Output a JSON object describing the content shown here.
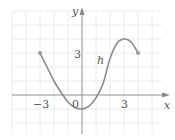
{
  "chart_data": {
    "type": "line",
    "title": "",
    "function_label": "h",
    "xlabel": "x",
    "ylabel": "y",
    "origin_label": "0",
    "x_tick_labels": [
      {
        "value": -3,
        "label": "−3"
      },
      {
        "value": 3,
        "label": "3"
      }
    ],
    "y_tick_labels": [
      {
        "value": 3,
        "label": "3"
      }
    ],
    "xlim": [
      -5,
      6
    ],
    "ylim": [
      -3,
      6
    ],
    "grid": true,
    "endpoints": [
      {
        "x": -3,
        "y": 3,
        "closed": true
      },
      {
        "x": 4,
        "y": 3,
        "closed": true
      }
    ],
    "series": [
      {
        "name": "h",
        "x": [
          -3,
          -2.5,
          -2,
          -1.5,
          -1,
          -0.5,
          0,
          0.5,
          1,
          1.5,
          2,
          2.5,
          3,
          3.5,
          4
        ],
        "y": [
          3,
          2,
          1,
          0.2,
          -0.5,
          -0.9,
          -1,
          -0.8,
          -0.2,
          0.8,
          2.6,
          3.7,
          4,
          3.8,
          3
        ]
      }
    ],
    "colors": {
      "curve": "#8a8a8a",
      "axes": "#999999",
      "grid": "#ececec"
    }
  }
}
